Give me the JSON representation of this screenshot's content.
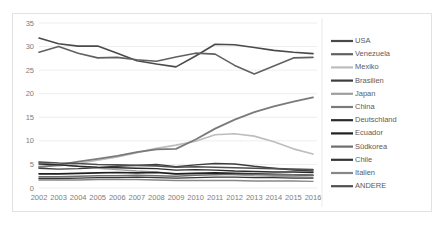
{
  "chart_data": {
    "type": "line",
    "title": "",
    "xlabel": "",
    "ylabel": "",
    "grid": "horizontal",
    "legend_position": "right",
    "ylim": [
      0,
      35
    ],
    "yticks": [
      0,
      5,
      10,
      15,
      20,
      25,
      30,
      35
    ],
    "categories": [
      "2002",
      "2003",
      "2004",
      "2005",
      "2006",
      "2007",
      "2008",
      "2009",
      "2010",
      "2011",
      "2012",
      "2013",
      "2014",
      "2015",
      "2016"
    ],
    "series": [
      {
        "name": "USA",
        "color": "#4a4a4a",
        "width": 1.6,
        "values": [
          31.8,
          30.6,
          30.1,
          30.1,
          28.6,
          27.0,
          26.3,
          25.7,
          28.0,
          30.5,
          30.4,
          29.8,
          29.2,
          28.8,
          28.5
        ]
      },
      {
        "name": "Venezuela",
        "color": "#616161",
        "width": 1.6,
        "values": [
          28.8,
          30.0,
          28.6,
          27.6,
          27.7,
          27.2,
          26.9,
          27.8,
          28.6,
          28.4,
          26.0,
          24.2,
          25.9,
          27.6,
          27.7
        ]
      },
      {
        "name": "Mexiko",
        "color": "#bdbdbd",
        "width": 1.6,
        "values": [
          4.6,
          4.7,
          5.2,
          5.9,
          6.6,
          7.5,
          8.4,
          9.1,
          9.9,
          11.3,
          11.5,
          11.0,
          9.8,
          8.3,
          7.2
        ]
      },
      {
        "name": "Brasilien",
        "color": "#3d3d3d",
        "width": 1.4,
        "values": [
          4.2,
          4.0,
          4.1,
          4.3,
          4.6,
          4.8,
          5.0,
          4.5,
          4.9,
          5.2,
          5.1,
          4.6,
          4.2,
          3.8,
          3.6
        ]
      },
      {
        "name": "Japan",
        "color": "#9e9e9e",
        "width": 1.4,
        "values": [
          5.4,
          4.9,
          4.6,
          4.2,
          3.9,
          3.6,
          3.4,
          3.0,
          3.1,
          3.0,
          2.8,
          2.6,
          2.5,
          2.4,
          2.3
        ]
      },
      {
        "name": "China",
        "color": "#7a7a7a",
        "width": 1.8,
        "values": [
          4.4,
          4.9,
          5.6,
          6.2,
          6.8,
          7.6,
          8.2,
          8.3,
          10.3,
          12.6,
          14.5,
          16.1,
          17.3,
          18.3,
          19.2
        ]
      },
      {
        "name": "Deutschland",
        "color": "#2b2b2b",
        "width": 1.4,
        "values": [
          5.1,
          4.9,
          4.6,
          4.4,
          4.3,
          4.2,
          4.1,
          3.8,
          3.9,
          3.8,
          3.6,
          3.5,
          3.4,
          3.4,
          3.3
        ]
      },
      {
        "name": "Ecuador",
        "color": "#1f1f1f",
        "width": 1.6,
        "values": [
          3.0,
          3.0,
          3.1,
          3.2,
          3.3,
          3.2,
          3.3,
          3.0,
          3.1,
          3.2,
          3.1,
          3.0,
          2.9,
          2.8,
          2.7
        ]
      },
      {
        "name": "Südkorea",
        "color": "#6e6e6e",
        "width": 1.4,
        "values": [
          2.4,
          2.4,
          2.5,
          2.6,
          2.6,
          2.7,
          2.6,
          2.5,
          2.7,
          2.8,
          2.9,
          2.9,
          2.8,
          2.8,
          2.7
        ]
      },
      {
        "name": "Chile",
        "color": "#353535",
        "width": 1.4,
        "values": [
          2.0,
          2.0,
          2.1,
          2.2,
          2.2,
          2.3,
          2.2,
          2.1,
          2.2,
          2.3,
          2.3,
          2.2,
          2.2,
          2.1,
          2.1
        ]
      },
      {
        "name": "Italien",
        "color": "#878787",
        "width": 1.4,
        "values": [
          1.7,
          1.7,
          1.7,
          1.8,
          1.8,
          1.8,
          1.7,
          1.6,
          1.6,
          1.6,
          1.6,
          1.5,
          1.5,
          1.5,
          1.4
        ]
      },
      {
        "name": "ANDERE",
        "color": "#4f4f4f",
        "width": 1.6,
        "values": [
          5.5,
          5.3,
          5.2,
          5.0,
          4.9,
          4.8,
          4.7,
          4.4,
          4.5,
          4.4,
          4.3,
          4.2,
          4.1,
          4.0,
          3.9
        ]
      }
    ]
  },
  "legend": {
    "items": [
      {
        "label": "USA"
      },
      {
        "label": "Venezuela"
      },
      {
        "label": "Mexiko"
      },
      {
        "label": "Brasilien"
      },
      {
        "label": "Japan"
      },
      {
        "label": "China"
      },
      {
        "label": "Deutschland"
      },
      {
        "label": "Ecuador"
      },
      {
        "label": "Südkorea"
      },
      {
        "label": "Chile"
      },
      {
        "label": "Italien"
      },
      {
        "label": "ANDERE"
      }
    ]
  }
}
